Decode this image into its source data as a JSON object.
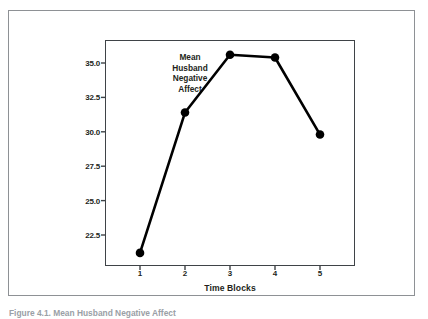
{
  "chart_data": {
    "type": "line",
    "title": "",
    "xlabel": "Time Blocks",
    "ylabel": "Estimated Marginal Means",
    "categories": [
      "1",
      "2",
      "3",
      "4",
      "5"
    ],
    "x": [
      1,
      2,
      3,
      4,
      5
    ],
    "values": [
      21.2,
      31.4,
      35.6,
      35.4,
      29.8
    ],
    "series": [
      {
        "name": "Mean Husband Negative Affect",
        "values": [
          21.2,
          31.4,
          35.6,
          35.4,
          29.8
        ]
      }
    ],
    "ytick_labels": [
      "35.0",
      "32.5",
      "30.0",
      "27.5",
      "25.0",
      "22.5"
    ],
    "ytick_values": [
      35.0,
      32.5,
      30.0,
      27.5,
      25.0,
      22.5
    ],
    "xtick_labels": [
      "1",
      "2",
      "3",
      "4",
      "5"
    ],
    "ylim": [
      20.5,
      36.3
    ],
    "xlim": [
      0.5,
      5.6
    ],
    "grid": false,
    "legend": "none",
    "annotations": [
      {
        "text_lines": [
          "Mean",
          "Husband",
          "Negative",
          "Affect"
        ],
        "at_x": 2.1,
        "at_y": 34.5
      }
    ],
    "line_color": "#000000",
    "marker_color": "#000000",
    "marker_shape": "circle",
    "axis_color": "#3f4347",
    "frame_color": "#8e9195"
  },
  "annotation": {
    "line1": "Mean",
    "line2": "Husband",
    "line3": "Negative",
    "line4": "Affect"
  },
  "axes": {
    "x_title": "Time Blocks",
    "y_title": "Estimated Marginal Means"
  },
  "caption": {
    "text": "Figure 4.1. Mean Husband Negative Affect"
  }
}
